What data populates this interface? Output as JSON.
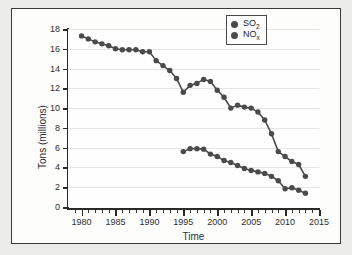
{
  "chart_data": {
    "type": "line",
    "title": "",
    "xlabel": "Time",
    "ylabel": "Tons (millions)",
    "xlim": [
      1978,
      2015
    ],
    "ylim": [
      0,
      18
    ],
    "xticks": [
      1980,
      1985,
      1990,
      1995,
      2000,
      2005,
      2010,
      2015
    ],
    "yticks": [
      0,
      2,
      4,
      6,
      8,
      10,
      12,
      14,
      16,
      18
    ],
    "xtick_labels": [
      "1980",
      "1985",
      "1990",
      "1995",
      "2000",
      "2005",
      "2010",
      "2015"
    ],
    "ytick_labels": [
      "0",
      "2",
      "4",
      "6",
      "8",
      "10",
      "12",
      "14",
      "16",
      "18"
    ],
    "minor_xtick_interval": 1,
    "grid": true,
    "grid_axis": "y",
    "legend_position": "top-right",
    "marker": "circle",
    "marker_color": "#4a4a4a",
    "line_color": "#4a4a4a",
    "series": [
      {
        "name": "SO2",
        "label_html": "SO<sub>2</sub>",
        "x": [
          1980,
          1981,
          1982,
          1983,
          1984,
          1985,
          1986,
          1987,
          1988,
          1989,
          1990,
          1991,
          1992,
          1993,
          1994,
          1995,
          1996,
          1997,
          1998,
          1999,
          2000,
          2001,
          2002,
          2003,
          2004,
          2005,
          2006,
          2007,
          2008,
          2009,
          2010,
          2011,
          2012,
          2013
        ],
        "values": [
          17.3,
          17.0,
          16.7,
          16.5,
          16.3,
          16.0,
          15.9,
          15.9,
          15.9,
          15.7,
          15.7,
          14.8,
          14.3,
          13.8,
          13.0,
          11.6,
          12.3,
          12.5,
          12.9,
          12.7,
          11.8,
          11.1,
          10.0,
          10.3,
          10.1,
          10.0,
          9.6,
          8.8,
          7.4,
          5.6,
          5.1,
          4.6,
          4.3,
          3.1
        ]
      },
      {
        "name": "NOx",
        "label_html": "NO<sub>x</sub>",
        "x": [
          1995,
          1996,
          1997,
          1998,
          1999,
          2000,
          2001,
          2002,
          2003,
          2004,
          2005,
          2006,
          2007,
          2008,
          2009,
          2010,
          2011,
          2012,
          2013
        ],
        "values": [
          5.6,
          5.9,
          5.9,
          5.85,
          5.35,
          5.1,
          4.7,
          4.5,
          4.2,
          3.9,
          3.7,
          3.55,
          3.4,
          3.1,
          2.65,
          1.85,
          1.95,
          1.7,
          1.4
        ]
      }
    ]
  },
  "legend": {
    "items": [
      {
        "label": "SO2",
        "display": "SO",
        "sub": "2"
      },
      {
        "label": "NOx",
        "display": "NO",
        "sub": "x"
      }
    ]
  }
}
